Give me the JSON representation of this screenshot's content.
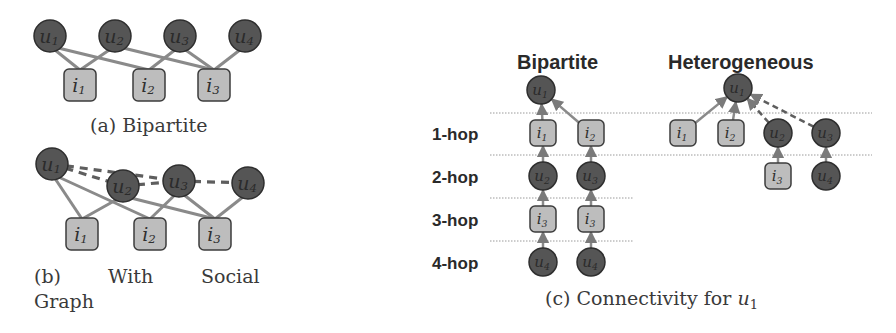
{
  "colors": {
    "user_fill": "#555555",
    "user_stroke": "#2e2e2e",
    "item_fill": "#bdbdbd",
    "item_stroke": "#3c3c3c",
    "edge": "#8a8a8a",
    "social_edge": "#5e5e5e",
    "hop_line": "#9a9a9a"
  },
  "panel_a": {
    "caption": "(a) Bipartite",
    "users": [
      {
        "id": "u1",
        "base": "u",
        "sub": "1",
        "x": 50,
        "y": 36
      },
      {
        "id": "u2",
        "base": "u",
        "sub": "2",
        "x": 115,
        "y": 36
      },
      {
        "id": "u3",
        "base": "u",
        "sub": "3",
        "x": 180,
        "y": 36
      },
      {
        "id": "u4",
        "base": "u",
        "sub": "4",
        "x": 245,
        "y": 36
      }
    ],
    "items": [
      {
        "id": "i1",
        "base": "i",
        "sub": "1",
        "x": 80,
        "y": 85
      },
      {
        "id": "i2",
        "base": "i",
        "sub": "2",
        "x": 149,
        "y": 85
      },
      {
        "id": "i3",
        "base": "i",
        "sub": "3",
        "x": 214,
        "y": 85
      }
    ],
    "interaction_edges": [
      [
        "u1",
        "i1"
      ],
      [
        "u1",
        "i2"
      ],
      [
        "u2",
        "i1"
      ],
      [
        "u2",
        "i3"
      ],
      [
        "u3",
        "i2"
      ],
      [
        "u3",
        "i3"
      ],
      [
        "u4",
        "i3"
      ]
    ]
  },
  "panel_b": {
    "caption_line1": [
      "(b)",
      "With",
      "Social"
    ],
    "caption_line2": "Graph",
    "users": [
      {
        "id": "u1",
        "base": "u",
        "sub": "1",
        "x": 52,
        "y": 164
      },
      {
        "id": "u2",
        "base": "u",
        "sub": "2",
        "x": 123,
        "y": 186
      },
      {
        "id": "u3",
        "base": "u",
        "sub": "3",
        "x": 179,
        "y": 181
      },
      {
        "id": "u4",
        "base": "u",
        "sub": "4",
        "x": 248,
        "y": 183
      }
    ],
    "items": [
      {
        "id": "i1",
        "base": "i",
        "sub": "1",
        "x": 82,
        "y": 234
      },
      {
        "id": "i2",
        "base": "i",
        "sub": "2",
        "x": 150,
        "y": 234
      },
      {
        "id": "i3",
        "base": "i",
        "sub": "3",
        "x": 215,
        "y": 234
      }
    ],
    "interaction_edges": [
      [
        "u1",
        "i1"
      ],
      [
        "u1",
        "i2"
      ],
      [
        "u2",
        "i1"
      ],
      [
        "u2",
        "i3"
      ],
      [
        "u3",
        "i2"
      ],
      [
        "u3",
        "i3"
      ],
      [
        "u4",
        "i3"
      ]
    ],
    "social_edges": [
      [
        "u1",
        "u3"
      ],
      [
        "u1",
        "u2"
      ],
      [
        "u2",
        "u3"
      ],
      [
        "u3",
        "u4"
      ]
    ]
  },
  "panel_c": {
    "caption_prefix": "(c) Connectivity for ",
    "caption_var": "u",
    "caption_sub": "1",
    "hop_labels": [
      {
        "text": "1-hop",
        "y": 134
      },
      {
        "text": "2-hop",
        "y": 177
      },
      {
        "text": "3-hop",
        "y": 220
      },
      {
        "text": "4-hop",
        "y": 263
      }
    ],
    "hop_lines": [
      {
        "y": 113,
        "x1": 490,
        "x2": 872
      },
      {
        "y": 155,
        "x1": 490,
        "x2": 872
      },
      {
        "y": 198,
        "x1": 490,
        "x2": 633
      },
      {
        "y": 241,
        "x1": 490,
        "x2": 633
      }
    ],
    "bipartite": {
      "title": "Bipartite",
      "root": {
        "id": "u1",
        "type": "user",
        "base": "u",
        "sub": "1",
        "x": 541,
        "y": 90
      },
      "nodes": [
        {
          "id": "b_i1",
          "type": "item",
          "base": "i",
          "sub": "1",
          "x": 543,
          "y": 133
        },
        {
          "id": "b_i2",
          "type": "item",
          "base": "i",
          "sub": "2",
          "x": 591,
          "y": 133
        },
        {
          "id": "b_u2",
          "type": "user",
          "base": "u",
          "sub": "2",
          "x": 543,
          "y": 176
        },
        {
          "id": "b_u3",
          "type": "user",
          "base": "u",
          "sub": "3",
          "x": 591,
          "y": 176
        },
        {
          "id": "b_i3a",
          "type": "item",
          "base": "i",
          "sub": "3",
          "x": 543,
          "y": 219
        },
        {
          "id": "b_i3b",
          "type": "item",
          "base": "i",
          "sub": "3",
          "x": 591,
          "y": 219
        },
        {
          "id": "b_u4a",
          "type": "user",
          "base": "u",
          "sub": "4",
          "x": 543,
          "y": 262
        },
        {
          "id": "b_u4b",
          "type": "user",
          "base": "u",
          "sub": "4",
          "x": 591,
          "y": 262
        }
      ],
      "arrows": [
        [
          "b_i1",
          "u1",
          "solid"
        ],
        [
          "b_i2",
          "u1",
          "solid"
        ],
        [
          "b_u2",
          "b_i1",
          "solid"
        ],
        [
          "b_u3",
          "b_i2",
          "solid"
        ],
        [
          "b_i3a",
          "b_u2",
          "solid"
        ],
        [
          "b_i3b",
          "b_u3",
          "solid"
        ],
        [
          "b_u4a",
          "b_i3a",
          "solid"
        ],
        [
          "b_u4b",
          "b_i3b",
          "solid"
        ]
      ]
    },
    "heterogeneous": {
      "title": "Heterogeneous",
      "root": {
        "id": "h_u1",
        "type": "user",
        "base": "u",
        "sub": "1",
        "x": 738,
        "y": 88
      },
      "nodes": [
        {
          "id": "h_i1",
          "type": "item",
          "base": "i",
          "sub": "1",
          "x": 683,
          "y": 133
        },
        {
          "id": "h_i2",
          "type": "item",
          "base": "i",
          "sub": "2",
          "x": 731,
          "y": 133
        },
        {
          "id": "h_u2",
          "type": "user",
          "base": "u",
          "sub": "2",
          "x": 778,
          "y": 133
        },
        {
          "id": "h_u3",
          "type": "user",
          "base": "u",
          "sub": "3",
          "x": 826,
          "y": 133
        },
        {
          "id": "h_i3",
          "type": "item",
          "base": "i",
          "sub": "3",
          "x": 778,
          "y": 176
        },
        {
          "id": "h_u4",
          "type": "user",
          "base": "u",
          "sub": "4",
          "x": 826,
          "y": 176
        }
      ],
      "arrows": [
        [
          "h_i1",
          "h_u1",
          "solid"
        ],
        [
          "h_i2",
          "h_u1",
          "solid"
        ],
        [
          "h_u2",
          "h_u1",
          "dashed"
        ],
        [
          "h_u3",
          "h_u1",
          "dashed"
        ],
        [
          "h_i3",
          "h_u2",
          "solid"
        ],
        [
          "h_u4",
          "h_u3",
          "solid"
        ]
      ]
    }
  }
}
